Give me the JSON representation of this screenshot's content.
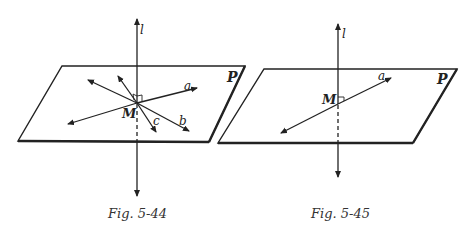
{
  "figures": [
    {
      "id": "fig-5-44",
      "caption": "Fig. 5-44",
      "plane_label": "P",
      "line_label": "l",
      "point_label": "M",
      "in_plane_lines": [
        "a",
        "b",
        "c"
      ]
    },
    {
      "id": "fig-5-45",
      "caption": "Fig. 5-45",
      "plane_label": "P",
      "line_label": "l",
      "point_label": "M",
      "in_plane_lines": [
        "a"
      ]
    }
  ],
  "colors": {
    "stroke": "#222222",
    "background": "#ffffff"
  }
}
